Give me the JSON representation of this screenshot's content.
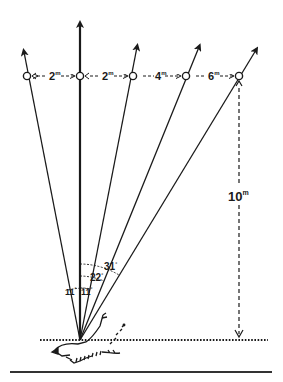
{
  "diagram": {
    "type": "fan-of-rays-geometry",
    "colors": {
      "ink": "#1a1a1a",
      "background": "#ffffff"
    },
    "spacing_labels": [
      {
        "value": "2",
        "unit": "m"
      },
      {
        "value": "2",
        "unit": "m"
      },
      {
        "value": "4",
        "unit": "m"
      },
      {
        "value": "6",
        "unit": "m"
      }
    ],
    "height_label": {
      "value": "10",
      "unit": "m"
    },
    "angle_labels": [
      {
        "value": "11",
        "unit": "°"
      },
      {
        "value": "11",
        "unit": "°"
      },
      {
        "value": "22",
        "unit": "°"
      },
      {
        "value": "31",
        "unit": "°"
      }
    ],
    "rays": 5,
    "markers": 5
  }
}
